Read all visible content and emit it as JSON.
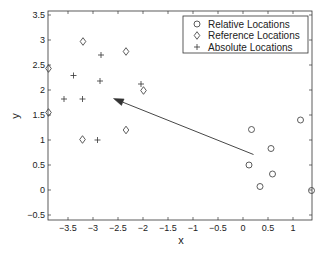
{
  "chart_data": {
    "type": "scatter",
    "title": "",
    "xlabel": "x",
    "ylabel": "y",
    "xlim": [
      -3.9,
      1.38
    ],
    "ylim": [
      -0.6,
      3.6
    ],
    "xticks": [
      -3.5,
      -3,
      -2.5,
      -2,
      -1.5,
      -1,
      -0.5,
      0,
      0.5,
      1
    ],
    "xtick_labels": [
      "−3.5",
      "−3",
      "−2.5",
      "−2",
      "−1.5",
      "−1",
      "−0.5",
      "0",
      "0.5",
      "1"
    ],
    "yticks": [
      -0.5,
      0,
      0.5,
      1,
      1.5,
      2,
      2.5,
      3,
      3.5
    ],
    "ytick_labels": [
      "−0.5",
      "0",
      "0.5",
      "1",
      "1.5",
      "2",
      "2.5",
      "3",
      "3.5"
    ],
    "grid": false,
    "legend_position": "upper right",
    "series": [
      {
        "name": "Relative Locations",
        "marker": "circle",
        "color": "#333333",
        "points": [
          {
            "x": 0.17,
            "y": 1.21
          },
          {
            "x": 1.15,
            "y": 1.4
          },
          {
            "x": 0.56,
            "y": 0.83
          },
          {
            "x": 0.12,
            "y": 0.5
          },
          {
            "x": 0.59,
            "y": 0.32
          },
          {
            "x": 0.34,
            "y": 0.07
          },
          {
            "x": 1.37,
            "y": -0.01
          }
        ]
      },
      {
        "name": "Reference Locations",
        "marker": "diamond",
        "color": "#333333",
        "points": [
          {
            "x": -3.2,
            "y": 2.97
          },
          {
            "x": -2.34,
            "y": 2.77
          },
          {
            "x": -3.89,
            "y": 2.43
          },
          {
            "x": -1.99,
            "y": 1.99
          },
          {
            "x": -3.89,
            "y": 1.55
          },
          {
            "x": -2.34,
            "y": 1.2
          },
          {
            "x": -3.21,
            "y": 1.01
          }
        ]
      },
      {
        "name": "Absolute Locations",
        "marker": "plus",
        "color": "#333333",
        "points": [
          {
            "x": -2.84,
            "y": 2.7
          },
          {
            "x": -3.39,
            "y": 2.29
          },
          {
            "x": -2.86,
            "y": 2.18
          },
          {
            "x": -2.04,
            "y": 2.12
          },
          {
            "x": -3.58,
            "y": 1.82
          },
          {
            "x": -3.21,
            "y": 1.82
          },
          {
            "x": -2.91,
            "y": 1.0
          }
        ]
      }
    ],
    "annotations": [
      {
        "type": "arrow",
        "from": {
          "x": 0.21,
          "y": 0.71
        },
        "to": {
          "x": -2.59,
          "y": 1.83
        }
      }
    ]
  },
  "legend": {
    "items": [
      {
        "label": "Relative Locations",
        "marker": "circle"
      },
      {
        "label": "Reference Locations",
        "marker": "diamond"
      },
      {
        "label": "Absolute Locations",
        "marker": "plus"
      }
    ]
  }
}
